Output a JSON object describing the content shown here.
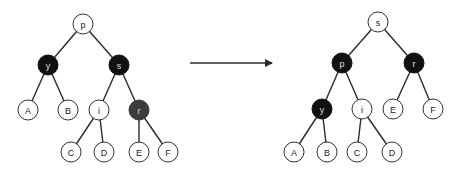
{
  "diagram": {
    "colors": {
      "black_node": "#111111",
      "red_node_shaded": "#3c3c3c",
      "white_node": "#ffffff",
      "edge": "#2a2a2a"
    },
    "before": {
      "nodes": [
        {
          "id": "L_p",
          "label": "p",
          "color": "white",
          "x": 83,
          "y": 24
        },
        {
          "id": "L_y",
          "label": "y",
          "color": "black",
          "x": 48,
          "y": 65
        },
        {
          "id": "L_s",
          "label": "s",
          "color": "black",
          "x": 119,
          "y": 65
        },
        {
          "id": "L_A",
          "label": "A",
          "color": "white",
          "x": 28,
          "y": 110
        },
        {
          "id": "L_B",
          "label": "B",
          "color": "white",
          "x": 68,
          "y": 110
        },
        {
          "id": "L_i",
          "label": "i",
          "color": "white",
          "x": 99,
          "y": 110
        },
        {
          "id": "L_r",
          "label": "r",
          "color": "gray",
          "x": 139,
          "y": 110
        },
        {
          "id": "L_C",
          "label": "C",
          "color": "white",
          "x": 71,
          "y": 152
        },
        {
          "id": "L_D",
          "label": "D",
          "color": "white",
          "x": 104,
          "y": 152
        },
        {
          "id": "L_E",
          "label": "E",
          "color": "white",
          "x": 139,
          "y": 152
        },
        {
          "id": "L_F",
          "label": "F",
          "color": "white",
          "x": 168,
          "y": 152
        }
      ],
      "edges": [
        [
          "L_p",
          "L_y"
        ],
        [
          "L_p",
          "L_s"
        ],
        [
          "L_y",
          "L_A"
        ],
        [
          "L_y",
          "L_B"
        ],
        [
          "L_s",
          "L_i"
        ],
        [
          "L_s",
          "L_r"
        ],
        [
          "L_i",
          "L_C"
        ],
        [
          "L_i",
          "L_D"
        ],
        [
          "L_r",
          "L_E"
        ],
        [
          "L_r",
          "L_F"
        ]
      ]
    },
    "arrow": {
      "x1": 190,
      "y1": 63,
      "x2": 272,
      "y2": 63
    },
    "after": {
      "nodes": [
        {
          "id": "R_s",
          "label": "s",
          "color": "white",
          "x": 378,
          "y": 22
        },
        {
          "id": "R_p",
          "label": "p",
          "color": "black",
          "x": 342,
          "y": 63
        },
        {
          "id": "R_r",
          "label": "r",
          "color": "black",
          "x": 414,
          "y": 63
        },
        {
          "id": "R_y",
          "label": "y",
          "color": "black",
          "x": 322,
          "y": 109
        },
        {
          "id": "R_i",
          "label": "i",
          "color": "white",
          "x": 362,
          "y": 109
        },
        {
          "id": "R_E",
          "label": "E",
          "color": "white",
          "x": 393,
          "y": 109
        },
        {
          "id": "R_F",
          "label": "F",
          "color": "white",
          "x": 433,
          "y": 109
        },
        {
          "id": "R_A",
          "label": "A",
          "color": "white",
          "x": 294,
          "y": 152
        },
        {
          "id": "R_B",
          "label": "B",
          "color": "white",
          "x": 327,
          "y": 152
        },
        {
          "id": "R_C",
          "label": "C",
          "color": "white",
          "x": 357,
          "y": 152
        },
        {
          "id": "R_D",
          "label": "D",
          "color": "white",
          "x": 392,
          "y": 152
        }
      ],
      "edges": [
        [
          "R_s",
          "R_p"
        ],
        [
          "R_s",
          "R_r"
        ],
        [
          "R_p",
          "R_y"
        ],
        [
          "R_p",
          "R_i"
        ],
        [
          "R_r",
          "R_E"
        ],
        [
          "R_r",
          "R_F"
        ],
        [
          "R_y",
          "R_A"
        ],
        [
          "R_y",
          "R_B"
        ],
        [
          "R_i",
          "R_C"
        ],
        [
          "R_i",
          "R_D"
        ]
      ]
    }
  }
}
